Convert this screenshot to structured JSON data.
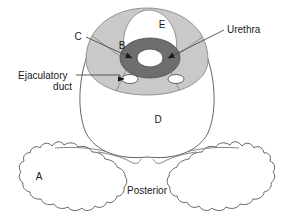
{
  "figure": {
    "type": "anatomical-cross-section",
    "background_color": "#ffffff",
    "width": 294,
    "height": 218
  },
  "colors": {
    "outline_stroke": "#555555",
    "zone_gray": "#c9c9c9",
    "zone_gray_dark": "#b5b5b5",
    "urethra_ring": "#6e6e6e",
    "urethra_lumen": "#ffffff",
    "duct_fill": "#ffffff",
    "text": "#1a1a1a",
    "leader_line": "#4a4a4a"
  },
  "labels": {
    "letter_a": "A",
    "letter_b": "B",
    "letter_c": "C",
    "letter_d": "D",
    "letter_e": "E",
    "urethra": "Urethra",
    "ejaculatory_duct_line1": "Ejaculatory",
    "ejaculatory_duct_line2": "duct",
    "posterior": "Posterior"
  },
  "annotations": [
    {
      "name": "label-c",
      "text": "C",
      "kind": "letter-callout",
      "has_leader": true,
      "has_arrow": true,
      "text_x": 78,
      "text_y": 36,
      "arrow_tip_x": 134,
      "arrow_tip_y": 60
    },
    {
      "name": "label-b",
      "text": "B",
      "kind": "letter-inline",
      "has_leader": false,
      "has_arrow": false,
      "text_x": 122,
      "text_y": 45
    },
    {
      "name": "label-e",
      "text": "E",
      "kind": "letter-inline",
      "has_leader": false,
      "has_arrow": false,
      "text_x": 162,
      "text_y": 24
    },
    {
      "name": "label-d",
      "text": "D",
      "kind": "letter-inline",
      "has_leader": false,
      "has_arrow": false,
      "text_x": 158,
      "text_y": 119
    },
    {
      "name": "label-a",
      "text": "A",
      "kind": "letter-inline",
      "has_leader": false,
      "has_arrow": false,
      "text_x": 39,
      "text_y": 176
    },
    {
      "name": "label-urethra",
      "text": "Urethra",
      "kind": "text-callout",
      "has_leader": true,
      "has_arrow": true,
      "text_x": 227,
      "text_y": 33,
      "arrow_tip_x": 166,
      "arrow_tip_y": 58
    },
    {
      "name": "label-ejaculatory-duct",
      "text": "Ejaculatory duct",
      "kind": "text-callout",
      "has_leader": true,
      "has_arrow": true,
      "text_x": 18,
      "text_y": 80,
      "arrow_tip_x": 122,
      "arrow_tip_y": 79
    },
    {
      "name": "label-posterior",
      "text": "Posterior",
      "kind": "orientation-label",
      "has_leader": false,
      "has_arrow": false,
      "text_x": 147,
      "text_y": 190
    }
  ],
  "structures": [
    {
      "name": "prostate-capsule",
      "fill": "#ffffff",
      "stroke": "#555555"
    },
    {
      "name": "peripheral-zone",
      "fill": "#c9c9c9",
      "stroke": "#8a8a8a"
    },
    {
      "name": "central-zone",
      "fill": "#ffffff",
      "stroke": "#8a8a8a"
    },
    {
      "name": "urethra-ring",
      "fill": "#6e6e6e",
      "stroke": "#555555"
    },
    {
      "name": "urethra-lumen",
      "fill": "#ffffff",
      "stroke": "#555555"
    },
    {
      "name": "ejaculatory-duct-left",
      "fill": "#ffffff",
      "stroke": "#555555"
    },
    {
      "name": "ejaculatory-duct-right",
      "fill": "#ffffff",
      "stroke": "#555555"
    },
    {
      "name": "levator-ani-left",
      "fill": "#ffffff",
      "stroke": "#777777"
    },
    {
      "name": "levator-ani-right",
      "fill": "#ffffff",
      "stroke": "#777777"
    }
  ]
}
